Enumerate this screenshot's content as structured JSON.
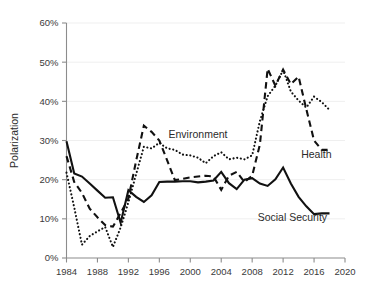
{
  "chart_data": {
    "type": "line",
    "title": "",
    "xlabel": "",
    "ylabel": "Polarization",
    "xlim": [
      1984,
      2020
    ],
    "ylim": [
      0,
      60
    ],
    "grid": true,
    "legend_position": "inline-annotations",
    "x_ticks": [
      "1984",
      "1988",
      "1992",
      "1996",
      "2000",
      "2004",
      "2008",
      "2012",
      "2016",
      "2020"
    ],
    "y_ticks": [
      "0%",
      "10%",
      "20%",
      "30%",
      "40%",
      "50%",
      "60%"
    ],
    "x": [
      1984,
      1985,
      1986,
      1987,
      1988,
      1989,
      1990,
      1991,
      1992,
      1993,
      1994,
      1995,
      1996,
      1997,
      1998,
      1999,
      2000,
      2001,
      2002,
      2003,
      2004,
      2005,
      2006,
      2007,
      2008,
      2009,
      2010,
      2011,
      2012,
      2013,
      2014,
      2015,
      2016,
      2017,
      2018
    ],
    "series": [
      {
        "name": "Social Security",
        "style": "solid",
        "color": "#111111",
        "label_text": "Social Security",
        "values": [
          29.8,
          21.6,
          20.8,
          19.0,
          17.2,
          15.4,
          15.5,
          9.0,
          17.3,
          15.6,
          14.3,
          16.0,
          19.4,
          19.5,
          19.5,
          19.6,
          19.6,
          19.3,
          19.5,
          19.8,
          22.0,
          19.1,
          17.6,
          20.0,
          20.4,
          19.0,
          18.4,
          20.1,
          23.1,
          19.0,
          15.6,
          13.2,
          11.2,
          11.4,
          11.4
        ]
      },
      {
        "name": "Health",
        "style": "dashed",
        "color": "#111111",
        "label_text": "Health",
        "values": [
          26.0,
          19.4,
          16.6,
          12.6,
          10.4,
          8.4,
          8.0,
          11.5,
          15.2,
          24.8,
          33.8,
          32.2,
          30.0,
          25.0,
          19.9,
          20.2,
          20.6,
          20.8,
          21.0,
          20.8,
          17.4,
          21.0,
          22.0,
          19.4,
          21.0,
          29.0,
          48.3,
          44.0,
          48.1,
          44.4,
          46.3,
          38.0,
          30.0,
          27.6,
          27.6
        ]
      },
      {
        "name": "Environment",
        "style": "dotted",
        "color": "#111111",
        "label_text": "Environment",
        "values": [
          21.8,
          12.9,
          3.4,
          5.6,
          6.8,
          7.9,
          2.8,
          7.8,
          14.2,
          21.4,
          28.4,
          28.0,
          29.4,
          28.0,
          27.6,
          26.4,
          26.2,
          25.6,
          24.2,
          26.0,
          27.0,
          25.2,
          25.6,
          25.2,
          26.2,
          35.0,
          41.3,
          44.0,
          48.0,
          42.5,
          40.2,
          38.4,
          41.2,
          39.8,
          37.8
        ]
      }
    ],
    "annotations": [
      {
        "text": "Environment",
        "x": 2001.0,
        "y": 30.7
      },
      {
        "text": "Health",
        "x": 2016.3,
        "y": 25.6
      },
      {
        "text": "Social Security",
        "x": 2013.2,
        "y": 9.5
      }
    ]
  }
}
